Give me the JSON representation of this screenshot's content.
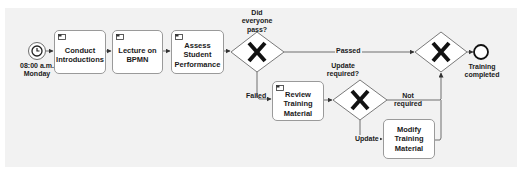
{
  "diagram": {
    "type": "BPMN process",
    "start_event": {
      "type": "timer",
      "icon": "clock-icon",
      "label": "08:00 a.m. Monday",
      "label_line1": "08:00 a.m.",
      "label_line2": "Monday"
    },
    "tasks": [
      {
        "id": "t1",
        "label_line1": "Conduct",
        "label_line2": "Introductions",
        "icon": "task-marker-icon"
      },
      {
        "id": "t2",
        "label_line1": "Lecture on",
        "label_line2": "BPMN",
        "icon": "task-marker-icon"
      },
      {
        "id": "t3",
        "label_line1": "Assess Student",
        "label_line2": "Performance",
        "icon": "task-marker-icon"
      },
      {
        "id": "t4",
        "label_line1": "Review",
        "label_line2": "Training",
        "label_line3": "Material",
        "icon": "task-marker-icon"
      },
      {
        "id": "t5",
        "label_line1": "Modify Training",
        "label_line2": "Material"
      }
    ],
    "gateways": [
      {
        "id": "g1",
        "type": "exclusive",
        "symbol": "X",
        "question_line1": "Did",
        "question_line2": "everyone",
        "question_line3": "pass?"
      },
      {
        "id": "g2",
        "type": "exclusive",
        "symbol": "X",
        "question_line1": "Update",
        "question_line2": "required?"
      },
      {
        "id": "g3",
        "type": "exclusive",
        "symbol": "X"
      }
    ],
    "flows": [
      {
        "from": "start",
        "to": "t1"
      },
      {
        "from": "t1",
        "to": "t2"
      },
      {
        "from": "t2",
        "to": "t3"
      },
      {
        "from": "t3",
        "to": "g1"
      },
      {
        "from": "g1",
        "to": "g3",
        "label": "Passed"
      },
      {
        "from": "g1",
        "to": "t4",
        "label": "Failed"
      },
      {
        "from": "t4",
        "to": "g2"
      },
      {
        "from": "g2",
        "to": "g3",
        "label_line1": "Not",
        "label_line2": "required"
      },
      {
        "from": "g2",
        "to": "t5",
        "label": "Update"
      },
      {
        "from": "t5",
        "to": "g3"
      },
      {
        "from": "g3",
        "to": "end"
      }
    ],
    "end_event": {
      "label_line1": "Training",
      "label_line2": "completed"
    },
    "colors": {
      "canvas": "#f2f2f2",
      "stroke": "#6e6e6e",
      "task_fill": "#ffffff",
      "text": "#1a1a1a"
    }
  }
}
